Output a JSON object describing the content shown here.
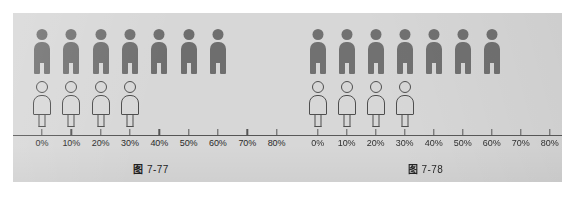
{
  "page": {
    "background": "#ffffff",
    "panel_color": "#d7d7d7"
  },
  "colors": {
    "solid_figure": "#6e6e6e",
    "outline_figure": "#4a4a4a",
    "axis": "#555555",
    "text": "#2a2a2a"
  },
  "chart_data": [
    {
      "id": "fig-7-77",
      "type": "bar",
      "title": "图 7-77",
      "caption_cjk": "图",
      "caption_number": "7-77",
      "xlabel": "",
      "ylabel": "",
      "orientation": "horizontal-pictogram",
      "grid": false,
      "legend": "none",
      "axis": {
        "ticks": [
          0,
          10,
          20,
          30,
          40,
          50,
          60,
          70,
          80
        ],
        "tick_labels": [
          "0%",
          "10%",
          "20%",
          "30%",
          "40%",
          "50%",
          "60%",
          "70%",
          "80%"
        ],
        "xlim": [
          0,
          80
        ],
        "unit": "%"
      },
      "series": [
        {
          "name": "solid-person-row",
          "glyph": "person-solid-icon",
          "style": "filled",
          "count": 7,
          "positions": [
            0,
            10,
            20,
            30,
            40,
            50,
            60
          ],
          "extent_percent": 60
        },
        {
          "name": "outline-person-row",
          "glyph": "person-outline-icon",
          "style": "outline",
          "count": 4,
          "positions": [
            0,
            10,
            20,
            30
          ],
          "extent_percent": 30
        }
      ]
    },
    {
      "id": "fig-7-78",
      "type": "bar",
      "title": "图 7-78",
      "caption_cjk": "图",
      "caption_number": "7-78",
      "xlabel": "",
      "ylabel": "",
      "orientation": "horizontal-pictogram",
      "grid": false,
      "legend": "none",
      "axis": {
        "ticks": [
          0,
          10,
          20,
          30,
          40,
          50,
          60,
          70,
          80
        ],
        "tick_labels": [
          "0%",
          "10%",
          "20%",
          "30%",
          "40%",
          "50%",
          "60%",
          "70%",
          "80%"
        ],
        "xlim": [
          0,
          80
        ],
        "unit": "%"
      },
      "series": [
        {
          "name": "solid-person-row",
          "glyph": "person-solid-icon",
          "style": "filled",
          "count": 7,
          "positions": [
            0,
            10,
            20,
            30,
            40,
            50,
            60
          ],
          "extent_percent": 60
        },
        {
          "name": "outline-person-row",
          "glyph": "person-outline-icon",
          "style": "outline",
          "count": 4,
          "positions": [
            0,
            10,
            20,
            30
          ],
          "extent_percent": 30
        }
      ]
    }
  ]
}
